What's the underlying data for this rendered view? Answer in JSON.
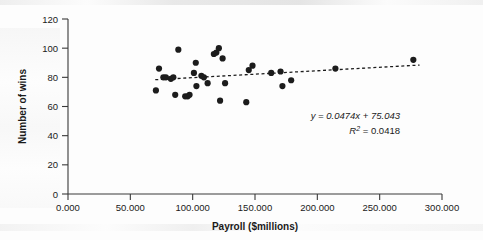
{
  "chart_data": {
    "type": "scatter",
    "title": "",
    "xlabel": "Payroll ($millions)",
    "ylabel": "Number of wins",
    "xlim": [
      0,
      300
    ],
    "ylim": [
      0,
      120
    ],
    "xticks": [
      0,
      50,
      100,
      150,
      200,
      250,
      300
    ],
    "xtick_labels": [
      "0.000",
      "50.000",
      "100.000",
      "150.000",
      "200.000",
      "250.000",
      "300.000"
    ],
    "yticks": [
      0,
      20,
      40,
      60,
      80,
      100,
      120
    ],
    "ytick_labels": [
      "0",
      "20",
      "40",
      "60",
      "80",
      "100",
      "120"
    ],
    "grid": false,
    "legend": null,
    "marker": "filled-circle",
    "marker_color": "#1c1c1c",
    "points": [
      {
        "x": 70.5,
        "y": 71
      },
      {
        "x": 73.0,
        "y": 86
      },
      {
        "x": 76.5,
        "y": 80
      },
      {
        "x": 78.5,
        "y": 80
      },
      {
        "x": 82.5,
        "y": 79
      },
      {
        "x": 84.5,
        "y": 80
      },
      {
        "x": 86.0,
        "y": 68
      },
      {
        "x": 88.5,
        "y": 99
      },
      {
        "x": 94.0,
        "y": 67
      },
      {
        "x": 96.0,
        "y": 67
      },
      {
        "x": 97.5,
        "y": 68
      },
      {
        "x": 101.0,
        "y": 83
      },
      {
        "x": 102.5,
        "y": 90
      },
      {
        "x": 103.0,
        "y": 74
      },
      {
        "x": 107.0,
        "y": 81
      },
      {
        "x": 109.0,
        "y": 80
      },
      {
        "x": 112.0,
        "y": 76
      },
      {
        "x": 117.0,
        "y": 96
      },
      {
        "x": 119.0,
        "y": 97
      },
      {
        "x": 121.0,
        "y": 100
      },
      {
        "x": 122.0,
        "y": 64
      },
      {
        "x": 124.0,
        "y": 93
      },
      {
        "x": 126.0,
        "y": 76
      },
      {
        "x": 143.0,
        "y": 63
      },
      {
        "x": 145.0,
        "y": 85
      },
      {
        "x": 148.0,
        "y": 88
      },
      {
        "x": 163.0,
        "y": 83
      },
      {
        "x": 170.5,
        "y": 84
      },
      {
        "x": 172.0,
        "y": 74
      },
      {
        "x": 179.0,
        "y": 78
      },
      {
        "x": 214.5,
        "y": 86
      },
      {
        "x": 277.0,
        "y": 92
      }
    ],
    "trendline": {
      "slope": 0.0474,
      "intercept": 75.043,
      "r_squared": 0.0418,
      "style": "dashed",
      "x_start": 70,
      "x_end": 282
    },
    "annotations": {
      "equation": "y = 0.0474x + 75.043",
      "equation_y": "y",
      "equation_rest": " = 0.0474x + 75.043",
      "r_squared_label": "R",
      "r_squared_sup": "2",
      "r_squared_value": " = 0.0418"
    }
  }
}
